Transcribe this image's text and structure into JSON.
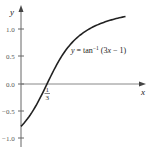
{
  "chart_data": {
    "type": "line",
    "title": "",
    "xlabel": "x",
    "ylabel": "y",
    "function": "y = tan^-1 (3x - 1)",
    "series": [
      {
        "name": "y = tan⁻¹ (3x − 1)",
        "x": [
          0.0,
          0.1,
          0.2,
          0.3333,
          0.5,
          0.7,
          0.9,
          1.1,
          1.36
        ],
        "values": [
          -0.785,
          -0.611,
          -0.381,
          0.0,
          0.464,
          0.833,
          1.03,
          1.143,
          1.257
        ]
      }
    ],
    "yticks": [
      1.0,
      0.5,
      0.0,
      -0.5,
      -1.0
    ],
    "ytick_labels": [
      "1.0",
      "0.5",
      "0.0",
      "−0.5",
      "−1.0"
    ],
    "annotations": [
      {
        "text": "1/3",
        "x": 0.3333,
        "y": 0.0,
        "position": "below x-intercept"
      },
      {
        "text": "y = tan⁻¹ (3x − 1)",
        "position": "right of curve, near y=0.6"
      }
    ],
    "ylim": [
      -1.15,
      1.5
    ],
    "xlim": [
      0,
      1.6
    ],
    "grid": false,
    "colors": {
      "curve": "#222222",
      "axes": "#666666"
    }
  },
  "labels": {
    "x_axis": "x",
    "y_axis": "y",
    "equation_prefix": "y = tan",
    "equation_sup": "−1",
    "equation_suffix": " (3x − 1)",
    "intercept_num": "1",
    "intercept_den": "3",
    "ytick_1": "1.0",
    "ytick_05": "0.5",
    "ytick_0": "0.0",
    "ytick_m05": "−0.5",
    "ytick_m1": "−1.0"
  }
}
